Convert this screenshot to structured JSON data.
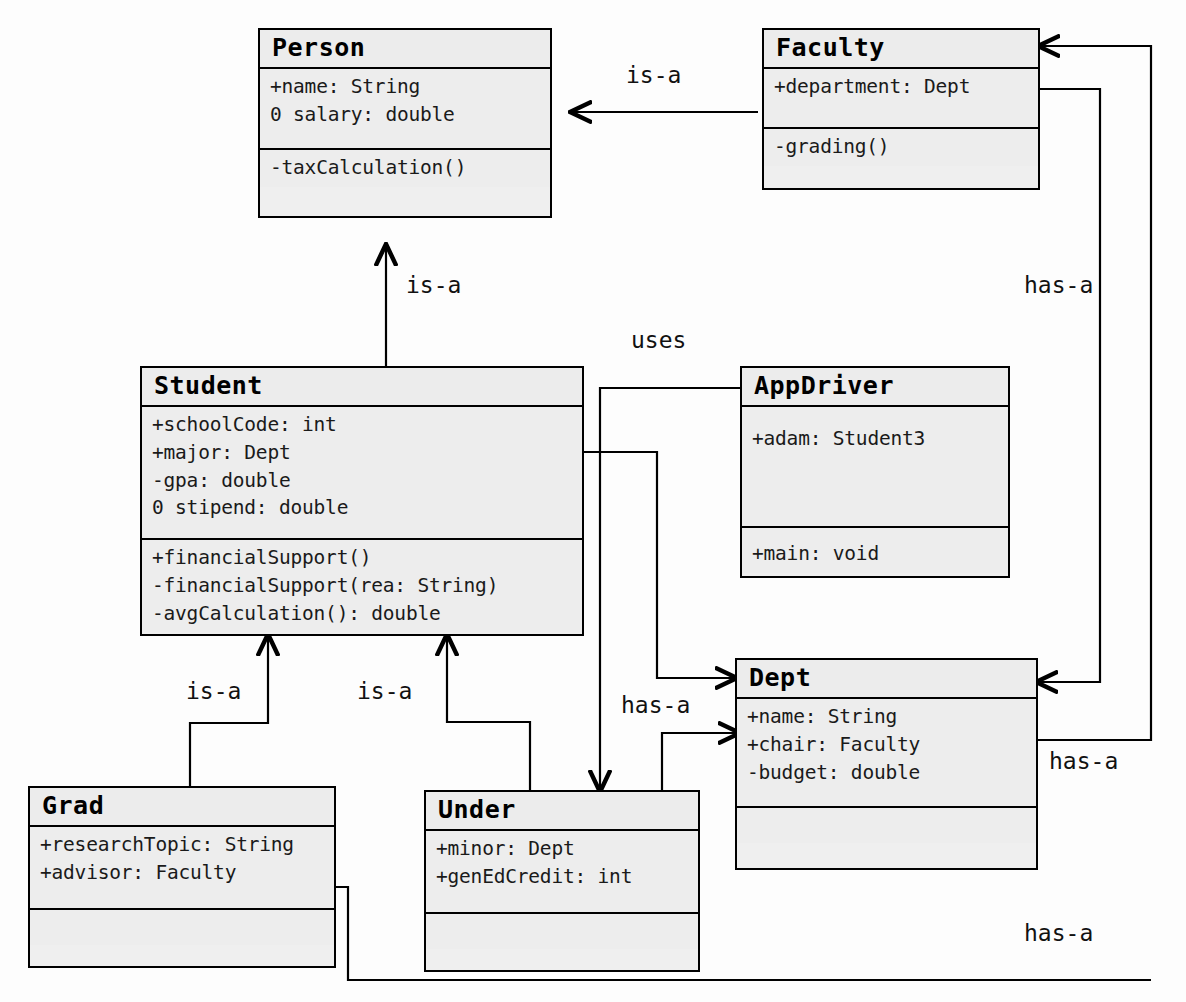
{
  "diagram": {
    "background_color": "#fdfdfd",
    "box_fill_color": "#ededed",
    "line_color": "#000000"
  },
  "classes": [
    {
      "id": "person",
      "name": "Person",
      "attributes": [
        "+name: String",
        "0 salary: double"
      ],
      "operations": [
        "-taxCalculation()"
      ]
    },
    {
      "id": "faculty",
      "name": "Faculty",
      "attributes": [
        "+department: Dept"
      ],
      "operations": [
        "-grading()"
      ]
    },
    {
      "id": "student",
      "name": "Student",
      "attributes": [
        "+schoolCode: int",
        "+major: Dept",
        "-gpa: double",
        "0 stipend: double"
      ],
      "operations": [
        "+financialSupport()",
        "-financialSupport(rea: String)",
        "-avgCalculation(): double"
      ]
    },
    {
      "id": "appdriver",
      "name": "AppDriver",
      "attributes": [
        "+adam: Student3"
      ],
      "operations": [
        "+main: void"
      ]
    },
    {
      "id": "dept",
      "name": "Dept",
      "attributes": [
        "+name: String",
        "+chair: Faculty",
        "-budget: double"
      ],
      "operations": []
    },
    {
      "id": "grad",
      "name": "Grad",
      "attributes": [
        "+researchTopic: String",
        "+advisor: Faculty"
      ],
      "operations": []
    },
    {
      "id": "under",
      "name": "Under",
      "attributes": [
        "+minor: Dept",
        "+genEdCredit: int"
      ],
      "operations": []
    }
  ],
  "relationships": [
    {
      "id": "faculty-person",
      "label": "is-a",
      "from": "faculty",
      "to": "person"
    },
    {
      "id": "student-person",
      "label": "is-a",
      "from": "student",
      "to": "person"
    },
    {
      "id": "grad-student",
      "label": "is-a",
      "from": "grad",
      "to": "student"
    },
    {
      "id": "under-student",
      "label": "is-a",
      "from": "under",
      "to": "student"
    },
    {
      "id": "appdriver-under",
      "label": "uses",
      "from": "appdriver",
      "to": "under"
    },
    {
      "id": "student-dept",
      "label": "has-a",
      "from": "student",
      "to": "dept"
    },
    {
      "id": "under-dept",
      "label": "has-a",
      "from": "under",
      "to": "dept"
    },
    {
      "id": "faculty-dept",
      "label": "has-a",
      "from": "faculty",
      "to": "dept"
    },
    {
      "id": "dept-faculty",
      "label": "has-a",
      "from": "dept",
      "to": "faculty"
    },
    {
      "id": "grad-faculty",
      "label": "has-a",
      "from": "grad",
      "to": "faculty"
    }
  ],
  "edge_labels": {
    "faculty_person": "is-a",
    "student_person": "is-a",
    "grad_student": "is-a",
    "under_student": "is-a",
    "appdriver_under": "uses",
    "under_dept": "has-a",
    "faculty_dept": "has-a",
    "dept_faculty": "has-a",
    "grad_faculty": "has-a"
  }
}
